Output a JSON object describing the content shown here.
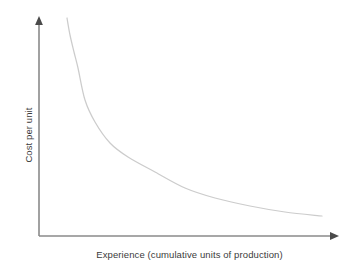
{
  "chart_data": {
    "type": "line",
    "title": "",
    "subtitle": "",
    "xlabel": "Experience (cumulative units of production)",
    "ylabel": "Cost per unit",
    "grid": false,
    "legend": false,
    "legend_position": "none",
    "axis_style": "arrow-headed open axes (no tick marks, no tick labels)",
    "xlim": [
      0,
      1
    ],
    "ylim": [
      0,
      1
    ],
    "x_tick_labels": [],
    "y_tick_labels": [],
    "annotations": [],
    "series": [
      {
        "name": "Experience curve",
        "color": "#cccccc",
        "description": "Steeply decreasing convex curve flattening to an asymptote at low cost per unit",
        "x": [
          0.13,
          0.15,
          0.17,
          0.19,
          0.22,
          0.26,
          0.31,
          0.37,
          0.44,
          0.52,
          0.6,
          0.69,
          0.78,
          0.87,
          0.95
        ],
        "y": [
          1.0,
          0.92,
          0.84,
          0.76,
          0.67,
          0.57,
          0.47,
          0.38,
          0.31,
          0.25,
          0.2,
          0.16,
          0.13,
          0.11,
          0.1
        ]
      }
    ],
    "points_px": [
      [
        67,
        18
      ],
      [
        70,
        35
      ],
      [
        74,
        52
      ],
      [
        78,
        68
      ],
      [
        85,
        100
      ],
      [
        95,
        122
      ],
      [
        110,
        143
      ],
      [
        128,
        157
      ],
      [
        155,
        172
      ],
      [
        185,
        188
      ],
      [
        215,
        198
      ],
      [
        250,
        206
      ],
      [
        285,
        212
      ],
      [
        322,
        216
      ]
    ],
    "colors": {
      "curve": "#cccccc",
      "axis": "#8a8a8a",
      "text": "#3b3b3b",
      "background": "#ffffff"
    }
  }
}
